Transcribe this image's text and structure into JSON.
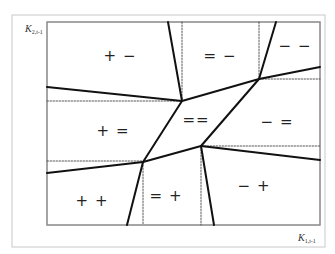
{
  "axes": {
    "y_label": {
      "base": "K",
      "sub": "2,t-1"
    },
    "x_label": {
      "base": "K",
      "sub": "1,t-1"
    }
  },
  "frame": {
    "outer": {
      "x1": 12,
      "y1": 15,
      "x2": 325,
      "y2": 247,
      "color": "#c8c8c8"
    },
    "plot": {
      "x1": 47,
      "y1": 22,
      "x2": 320,
      "y2": 225,
      "color": "#888888"
    }
  },
  "regions": [
    {
      "id": "plus-minus",
      "label": "+ −",
      "x": 120,
      "y": 56
    },
    {
      "id": "equal-minus",
      "label": "= −",
      "x": 220,
      "y": 56
    },
    {
      "id": "minus-minus",
      "label": "− −",
      "x": 295,
      "y": 46
    },
    {
      "id": "plus-equal",
      "label": "+ =",
      "x": 113,
      "y": 131
    },
    {
      "id": "equal-equal",
      "label": "==",
      "x": 196,
      "y": 120
    },
    {
      "id": "minus-equal",
      "label": "− =",
      "x": 277,
      "y": 122
    },
    {
      "id": "plus-plus",
      "label": "+ +",
      "x": 92,
      "y": 201
    },
    {
      "id": "equal-plus",
      "label": "= +",
      "x": 166,
      "y": 196
    },
    {
      "id": "minus-plus",
      "label": "− +",
      "x": 254,
      "y": 186
    }
  ],
  "vertices": {
    "A": {
      "x": 182,
      "y": 101
    },
    "B": {
      "x": 259,
      "y": 79
    },
    "C": {
      "x": 143,
      "y": 162
    },
    "D": {
      "x": 201,
      "y": 146
    }
  },
  "solid_lines": [
    {
      "x1": 168,
      "y1": 22,
      "x2": 182,
      "y2": 101
    },
    {
      "x1": 47,
      "y1": 87,
      "x2": 182,
      "y2": 101
    },
    {
      "x1": 182,
      "y1": 101,
      "x2": 259,
      "y2": 79
    },
    {
      "x1": 276,
      "y1": 22,
      "x2": 259,
      "y2": 79
    },
    {
      "x1": 259,
      "y1": 79,
      "x2": 320,
      "y2": 67
    },
    {
      "x1": 182,
      "y1": 101,
      "x2": 143,
      "y2": 162
    },
    {
      "x1": 259,
      "y1": 79,
      "x2": 201,
      "y2": 146
    },
    {
      "x1": 143,
      "y1": 162,
      "x2": 201,
      "y2": 146
    },
    {
      "x1": 47,
      "y1": 173,
      "x2": 143,
      "y2": 162
    },
    {
      "x1": 143,
      "y1": 162,
      "x2": 127,
      "y2": 225
    },
    {
      "x1": 201,
      "y1": 146,
      "x2": 320,
      "y2": 160
    },
    {
      "x1": 201,
      "y1": 146,
      "x2": 214,
      "y2": 225
    }
  ],
  "dotted_lines": [
    {
      "x1": 182,
      "y1": 22,
      "x2": 182,
      "y2": 101
    },
    {
      "x1": 47,
      "y1": 101,
      "x2": 182,
      "y2": 101
    },
    {
      "x1": 259,
      "y1": 22,
      "x2": 259,
      "y2": 79
    },
    {
      "x1": 259,
      "y1": 79,
      "x2": 320,
      "y2": 79
    },
    {
      "x1": 47,
      "y1": 161,
      "x2": 143,
      "y2": 161
    },
    {
      "x1": 143,
      "y1": 162,
      "x2": 143,
      "y2": 225
    },
    {
      "x1": 201,
      "y1": 146,
      "x2": 320,
      "y2": 146
    },
    {
      "x1": 201,
      "y1": 146,
      "x2": 201,
      "y2": 225
    }
  ],
  "style": {
    "solid_color": "#111111",
    "solid_width": 2,
    "dotted_color": "#555555",
    "dotted_width": 1
  }
}
